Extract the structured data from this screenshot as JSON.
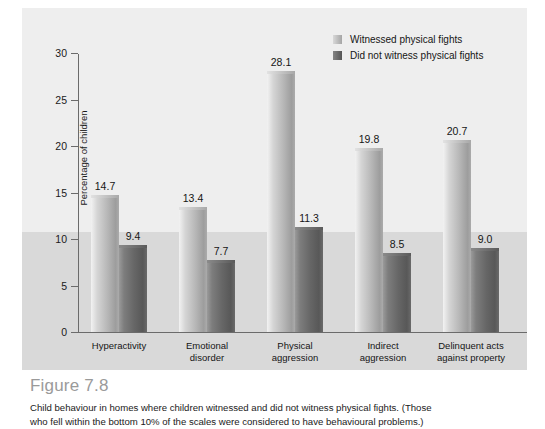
{
  "figure": {
    "number": "Figure 7.8",
    "caption_line1": "Child behaviour in homes where children witnessed and did not witness physical fights. (Those",
    "caption_line2": "who fell within the bottom 10% of the scales were considered to have behavioural problems.)"
  },
  "legend": {
    "items": [
      {
        "label": "Witnessed physical fights",
        "color": "#b4b4b4",
        "swatch": "light"
      },
      {
        "label": "Did not witness physical fights",
        "color": "#666666",
        "swatch": "dark"
      }
    ]
  },
  "axis": {
    "y_label": "Percentage of children",
    "y_ticks": [
      "0",
      "5",
      "10",
      "15",
      "20",
      "25",
      "30"
    ]
  },
  "chart_data": {
    "type": "bar",
    "title": "",
    "xlabel": "",
    "ylabel": "Percentage of children",
    "ylim": [
      0,
      30
    ],
    "ytick_step": 5,
    "grid": false,
    "legend_position": "top-right",
    "categories": [
      "Hyperactivity",
      "Emotional\ndisorder",
      "Physical\naggression",
      "Indirect\naggression",
      "Delinquent acts\nagainst property"
    ],
    "series": [
      {
        "name": "Witnessed physical fights",
        "color": "#b4b4b4",
        "values": [
          14.7,
          13.4,
          28.1,
          19.8,
          20.7
        ],
        "labels": [
          "14.7",
          "13.4",
          "28.1",
          "19.8",
          "20.7"
        ]
      },
      {
        "name": "Did not witness physical fights",
        "color": "#666666",
        "values": [
          9.4,
          7.7,
          11.3,
          8.5,
          9.0
        ],
        "labels": [
          "9.4",
          "7.7",
          "11.3",
          "8.5",
          "9.0"
        ]
      }
    ]
  }
}
